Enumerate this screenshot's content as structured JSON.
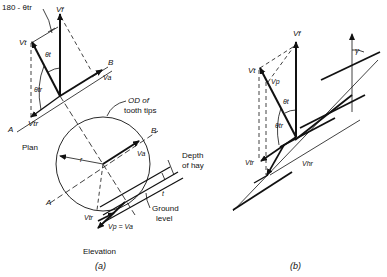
{
  "figure_a": {
    "caption": "(a)",
    "plan_label": "Plan",
    "elevation_label": "Elevation",
    "angle_180": "180 - θtr",
    "vf": "Vf",
    "vt": "Vt",
    "theta_t": "θt",
    "theta_tr": "θtr",
    "va": "Va",
    "vtr": "Vtr",
    "axis_a": "A",
    "axis_b": "B",
    "od_label_1": "OD of",
    "od_label_2": "tooth tips",
    "radius": "r",
    "depth_1": "Depth",
    "depth_2": "of hay",
    "t": "t",
    "ground_1": "Ground",
    "ground_2": "level",
    "vtr_elev": "Vtr",
    "vp_eq": "Vp = Va"
  },
  "figure_b": {
    "caption": "(b)",
    "vf": "Vf",
    "vt": "Vt",
    "vp": "Vp",
    "theta_t": "θt",
    "theta_tr": "θtr",
    "vtr": "Vtr",
    "vhr": "Vhr",
    "gamma": "γ"
  }
}
